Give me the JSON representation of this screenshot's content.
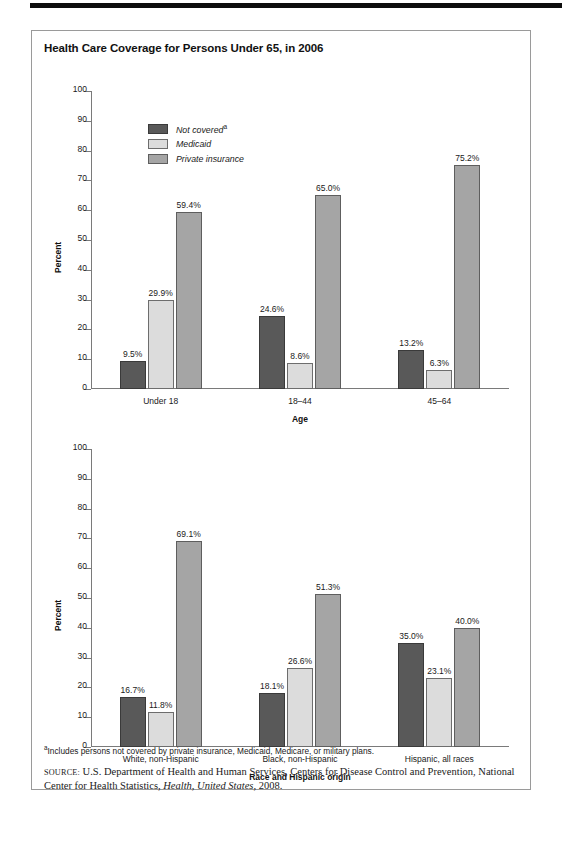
{
  "figure": {
    "title": "Health Care Coverage for Persons Under 65, in 2006",
    "legend": [
      {
        "label": "Not covered",
        "superscript": "a",
        "color": "#595959"
      },
      {
        "label": "Medicaid",
        "superscript": "",
        "color": "#dcdcdc"
      },
      {
        "label": "Private insurance",
        "superscript": "",
        "color": "#a5a5a5"
      }
    ],
    "footnote_marker": "a",
    "footnote": "Includes persons not covered by private insurance, Medicaid, Medicare, or military plans.",
    "source_label": "SOURCE:",
    "source_text_1": "U.S. Department of Health and Human Services, Centers for Disease Control and Prevention, National Center for Health Statistics,",
    "source_italic": "Health, United States",
    "source_text_2": ", 2008."
  },
  "chart_data": [
    {
      "type": "bar",
      "title": "Health Care Coverage for Persons Under 65, in 2006",
      "id": "age",
      "categories": [
        "Under 18",
        "18–44",
        "45–64"
      ],
      "series": [
        {
          "name": "Not covered",
          "values": [
            9.5,
            24.6,
            13.2
          ],
          "labels": [
            "9.5%",
            "24.6%",
            "13.2%"
          ],
          "color": "#595959"
        },
        {
          "name": "Medicaid",
          "values": [
            29.9,
            8.6,
            6.3
          ],
          "labels": [
            "29.9%",
            "8.6%",
            "6.3%"
          ],
          "color": "#dcdcdc"
        },
        {
          "name": "Private insurance",
          "values": [
            59.4,
            65.0,
            75.2
          ],
          "labels": [
            "59.4%",
            "65.0%",
            "75.2%"
          ],
          "color": "#a5a5a5"
        }
      ],
      "xlabel": "Age",
      "ylabel": "Percent",
      "ylim": [
        0,
        100
      ],
      "yticks": [
        0,
        10,
        20,
        30,
        40,
        50,
        60,
        70,
        80,
        90,
        100
      ],
      "ytick_labels": [
        "0",
        "10",
        "20",
        "30",
        "40",
        "50",
        "60",
        "70",
        "80",
        "90",
        "100"
      ],
      "grid": false,
      "legend_position": "top-left"
    },
    {
      "type": "bar",
      "id": "race",
      "categories": [
        "White, non-Hispanic",
        "Black, non-Hispanic",
        "Hispanic, all races"
      ],
      "series": [
        {
          "name": "Not covered",
          "values": [
            16.7,
            18.1,
            35.0
          ],
          "labels": [
            "16.7%",
            "18.1%",
            "35.0%"
          ],
          "color": "#595959"
        },
        {
          "name": "Medicaid",
          "values": [
            11.8,
            26.6,
            23.1
          ],
          "labels": [
            "11.8%",
            "26.6%",
            "23.1%"
          ],
          "color": "#dcdcdc"
        },
        {
          "name": "Private insurance",
          "values": [
            69.1,
            51.3,
            40.0
          ],
          "labels": [
            "69.1%",
            "51.3%",
            "40.0%"
          ],
          "color": "#a5a5a5"
        }
      ],
      "xlabel": "Race and Hispanic origin",
      "ylabel": "Percent",
      "ylim": [
        0,
        100
      ],
      "yticks": [
        0,
        10,
        20,
        30,
        40,
        50,
        60,
        70,
        80,
        90,
        100
      ],
      "ytick_labels": [
        "0",
        "10",
        "20",
        "30",
        "40",
        "50",
        "60",
        "70",
        "80",
        "90",
        "100"
      ],
      "grid": false,
      "legend_position": "none"
    }
  ]
}
